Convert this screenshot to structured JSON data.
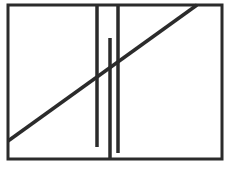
{
  "figure": {
    "width": 228,
    "height": 170,
    "background": "#ffffff",
    "stroke_color": "#2b2b2b",
    "stroke_width": 3,
    "frame": {
      "x": 8,
      "y": 5,
      "width": 214,
      "height": 154
    },
    "diagonal": {
      "x1": 8,
      "y1": 141,
      "x2": 197,
      "y2": 5
    },
    "vertical_bars": [
      {
        "name": "left-bar",
        "x": 97,
        "y1": 5,
        "y2": 147
      },
      {
        "name": "middle-bar",
        "x": 110,
        "y1": 38,
        "y2": 159
      },
      {
        "name": "right-bar",
        "x": 118,
        "y1": 5,
        "y2": 153
      }
    ]
  }
}
